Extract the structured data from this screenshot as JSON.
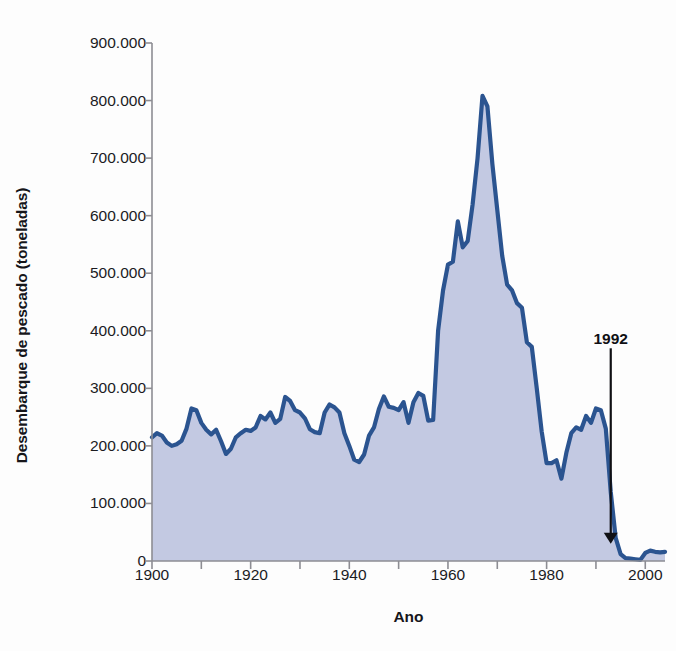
{
  "chart_data": {
    "type": "area",
    "title": "",
    "xlabel": "Ano",
    "ylabel": "Desembarque de pescado (toneladas)",
    "xlim": [
      1900,
      2004
    ],
    "ylim": [
      0,
      900000
    ],
    "grid": false,
    "legend": "none",
    "line_color": "#2b5490",
    "fill_color": "#c3c9e2",
    "xticks": [
      1900,
      1920,
      1940,
      1960,
      1980,
      2000
    ],
    "xtick_labels": [
      "1900",
      "1920",
      "1940",
      "1960",
      "1980",
      "2000"
    ],
    "xminor_tick_step": 10,
    "yticks": [
      0,
      100000,
      200000,
      300000,
      400000,
      500000,
      600000,
      700000,
      800000,
      900000
    ],
    "ytick_labels": [
      "0",
      "100.000",
      "200.000",
      "300.000",
      "400.000",
      "500.000",
      "600.000",
      "700.000",
      "800.000",
      "900.000"
    ],
    "annotations": [
      {
        "text": "1992",
        "x": 1993,
        "y_label": 380000,
        "y_arrow_tip": 30000,
        "style": "down-arrow"
      }
    ],
    "series": [
      {
        "name": "Desembarque de pescado",
        "x": [
          1900,
          1901,
          1902,
          1903,
          1904,
          1905,
          1906,
          1907,
          1908,
          1909,
          1910,
          1911,
          1912,
          1913,
          1914,
          1915,
          1916,
          1917,
          1918,
          1919,
          1920,
          1921,
          1922,
          1923,
          1924,
          1925,
          1926,
          1927,
          1928,
          1929,
          1930,
          1931,
          1932,
          1933,
          1934,
          1935,
          1936,
          1937,
          1938,
          1939,
          1940,
          1941,
          1942,
          1943,
          1944,
          1945,
          1946,
          1947,
          1948,
          1949,
          1950,
          1951,
          1952,
          1953,
          1954,
          1955,
          1956,
          1957,
          1958,
          1959,
          1960,
          1961,
          1962,
          1963,
          1964,
          1965,
          1966,
          1967,
          1968,
          1969,
          1970,
          1971,
          1972,
          1973,
          1974,
          1975,
          1976,
          1977,
          1978,
          1979,
          1980,
          1981,
          1982,
          1983,
          1984,
          1985,
          1986,
          1987,
          1988,
          1989,
          1990,
          1991,
          1992,
          1993,
          1994,
          1995,
          1996,
          1997,
          1998,
          1999,
          2000,
          2001,
          2002,
          2003,
          2004
        ],
        "values": [
          215000,
          222000,
          218000,
          206000,
          200000,
          203000,
          209000,
          230000,
          265000,
          262000,
          240000,
          228000,
          220000,
          228000,
          208000,
          186000,
          195000,
          215000,
          222000,
          228000,
          226000,
          232000,
          252000,
          246000,
          258000,
          240000,
          247000,
          285000,
          278000,
          262000,
          258000,
          248000,
          229000,
          224000,
          222000,
          258000,
          272000,
          267000,
          258000,
          222000,
          200000,
          176000,
          172000,
          185000,
          218000,
          232000,
          264000,
          286000,
          268000,
          266000,
          262000,
          276000,
          240000,
          276000,
          292000,
          287000,
          244000,
          245000,
          400000,
          470000,
          515000,
          520000,
          590000,
          545000,
          556000,
          620000,
          700000,
          808000,
          790000,
          690000,
          610000,
          530000,
          480000,
          470000,
          448000,
          440000,
          380000,
          372000,
          300000,
          225000,
          170000,
          170000,
          175000,
          143000,
          188000,
          222000,
          232000,
          228000,
          252000,
          240000,
          265000,
          262000,
          230000,
          120000,
          40000,
          12000,
          5000,
          4000,
          3000,
          2000,
          14000,
          18000,
          16000,
          15000,
          16000
        ]
      }
    ]
  },
  "axis": {
    "ylabel_text": "Desembarque de pescado (toneladas)",
    "xlabel_text": "Ano"
  },
  "geometry": {
    "plot_left": 152,
    "plot_right": 665,
    "plot_top": 43,
    "plot_bottom": 561
  }
}
